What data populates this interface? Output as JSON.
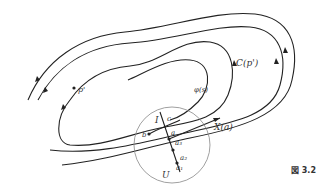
{
  "figure": {
    "caption": "図 3.2",
    "labels": {
      "p_prime": "p'",
      "C_p_prime": "C(p')",
      "phi_s": "φ(s)",
      "I": "I",
      "c": "c",
      "b": "b",
      "a": "a",
      "a3": "a₃",
      "a2": "a₂",
      "a1": "a₁",
      "X_a": "X(a)",
      "U": "U"
    },
    "colors": {
      "stroke": "#222222",
      "circle": "#888888",
      "background": "#ffffff"
    }
  }
}
